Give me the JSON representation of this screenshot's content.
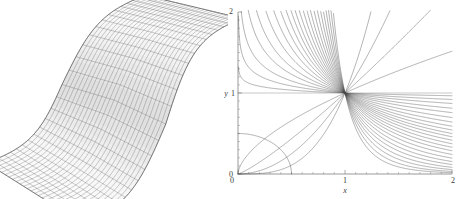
{
  "figure": {
    "title": "",
    "background_color": "#ffffff",
    "panels": [
      {
        "id": "surface-panel",
        "kind": "3d-wireframe-surface"
      },
      {
        "id": "curves-panel",
        "kind": "2d-line-family"
      }
    ]
  },
  "surface_plot": {
    "name": "3d-mesh-surface",
    "description": "Twisted saddle wireframe mesh surface",
    "mesh_color": "#555555",
    "shade_color": "#8a8a8a",
    "grid_u_lines": 26,
    "grid_v_lines": 26,
    "axes_visible": false
  },
  "chart_data": {
    "type": "line",
    "title": "",
    "subtitle": "",
    "xlabel": "x",
    "ylabel": "y",
    "xlim": [
      0,
      2
    ],
    "ylim": [
      0,
      2
    ],
    "xticks": [
      0,
      1,
      2
    ],
    "xticklabels": [
      "0",
      "1",
      "2"
    ],
    "yticks": [
      0,
      1,
      2
    ],
    "yticklabels": [
      "0",
      "1",
      "2"
    ],
    "minor_ticks": true,
    "grid": false,
    "legend": null,
    "line_color": "#4a4a4a",
    "common_point": [
      1,
      1
    ],
    "family_description": "Family of power curves y = x^k all passing through (1,1)",
    "exponents": [
      -6.0,
      -5.0,
      -4.2,
      -3.6,
      -3.1,
      -2.7,
      -2.35,
      -2.05,
      -1.8,
      -1.6,
      -1.42,
      -1.26,
      -1.12,
      -1.0,
      -0.88,
      -0.76,
      -0.64,
      -0.52,
      -0.4,
      -0.3,
      -0.2,
      -0.12,
      -0.05,
      0.0,
      0.6,
      1.2,
      2.0,
      3.2
    ],
    "series": [
      {
        "name": "y = x^-6.0",
        "exponent": -6.0,
        "x": [
          0.02,
          0.5,
          0.75,
          1.0,
          1.25,
          1.5,
          2.0
        ],
        "values": [
          2.0,
          2.0,
          2.0,
          1.0,
          0.262,
          0.088,
          0.0156
        ]
      },
      {
        "name": "y = x^-5.0",
        "exponent": -5.0,
        "x": [
          0.02,
          0.5,
          0.75,
          1.0,
          1.25,
          1.5,
          2.0
        ],
        "values": [
          2.0,
          2.0,
          2.0,
          1.0,
          0.328,
          0.132,
          0.0313
        ]
      },
      {
        "name": "y = x^-4.2",
        "exponent": -4.2,
        "x": [
          0.02,
          0.5,
          0.75,
          1.0,
          1.25,
          1.5,
          2.0
        ],
        "values": [
          2.0,
          2.0,
          2.0,
          1.0,
          0.389,
          0.178,
          0.0544
        ]
      },
      {
        "name": "y = x^-3.6",
        "exponent": -3.6,
        "x": [
          0.02,
          0.5,
          0.75,
          1.0,
          1.25,
          1.5,
          2.0
        ],
        "values": [
          2.0,
          2.0,
          2.0,
          1.0,
          0.443,
          0.222,
          0.0825
        ]
      },
      {
        "name": "y = x^-3.1",
        "exponent": -3.1,
        "x": [
          0.02,
          0.5,
          0.75,
          1.0,
          1.25,
          1.5,
          2.0
        ],
        "values": [
          2.0,
          2.0,
          2.0,
          1.0,
          0.496,
          0.268,
          0.1166
        ]
      },
      {
        "name": "y = x^-2.7",
        "exponent": -2.7,
        "x": [
          0.02,
          0.5,
          0.75,
          1.0,
          1.25,
          1.5,
          2.0
        ],
        "values": [
          2.0,
          2.0,
          2.0,
          1.0,
          0.545,
          0.313,
          0.1539
        ]
      },
      {
        "name": "y = x^-2.35",
        "exponent": -2.35,
        "x": [
          0.02,
          0.5,
          0.75,
          1.0,
          1.25,
          1.5,
          2.0
        ],
        "values": [
          2.0,
          2.0,
          2.0,
          1.0,
          0.594,
          0.36,
          0.196
        ]
      },
      {
        "name": "y = x^-2.05",
        "exponent": -2.05,
        "x": [
          0.02,
          0.5,
          0.75,
          1.0,
          1.25,
          1.5,
          2.0
        ],
        "values": [
          2.0,
          2.0,
          2.0,
          1.0,
          0.639,
          0.406,
          0.2415
        ]
      },
      {
        "name": "y = x^-1.8",
        "exponent": -1.8,
        "x": [
          0.02,
          0.5,
          0.75,
          1.0,
          1.25,
          1.5,
          2.0
        ],
        "values": [
          2.0,
          2.0,
          1.556,
          1.0,
          0.68,
          0.449,
          0.2872
        ]
      },
      {
        "name": "y = x^-1.6",
        "exponent": -1.6,
        "x": [
          0.02,
          0.5,
          0.75,
          1.0,
          1.25,
          1.5,
          2.0
        ],
        "values": [
          2.0,
          2.0,
          1.48,
          1.0,
          0.714,
          0.487,
          0.3299
        ]
      },
      {
        "name": "y = x^-1.42",
        "exponent": -1.42,
        "x": [
          0.02,
          0.5,
          0.75,
          1.0,
          1.25,
          1.5,
          2.0
        ],
        "values": [
          2.0,
          2.0,
          1.418,
          1.0,
          0.745,
          0.524,
          0.374
        ]
      },
      {
        "name": "y = x^-1.26",
        "exponent": -1.26,
        "x": [
          0.02,
          0.5,
          0.75,
          1.0,
          1.25,
          1.5,
          2.0
        ],
        "values": [
          2.0,
          2.0,
          1.365,
          1.0,
          0.773,
          0.558,
          0.4175
        ]
      },
      {
        "name": "y = x^-1.12",
        "exponent": -1.12,
        "x": [
          0.02,
          0.5,
          0.75,
          1.0,
          1.25,
          1.5,
          2.0
        ],
        "values": [
          2.0,
          2.0,
          1.321,
          1.0,
          0.797,
          0.589,
          0.4604
        ]
      },
      {
        "name": "y = x^-1.0",
        "exponent": -1.0,
        "x": [
          0.02,
          0.5,
          0.75,
          1.0,
          1.25,
          1.5,
          2.0
        ],
        "values": [
          2.0,
          2.0,
          1.333,
          1.0,
          0.8,
          0.667,
          0.5
        ]
      },
      {
        "name": "y = x^-0.88",
        "exponent": -0.88,
        "x": [
          0.02,
          0.5,
          0.75,
          1.0,
          1.25,
          1.5,
          2.0
        ],
        "values": [
          2.0,
          1.84,
          1.247,
          1.0,
          0.838,
          0.683,
          0.5437
        ]
      },
      {
        "name": "y = x^-0.76",
        "exponent": -0.76,
        "x": [
          0.02,
          0.5,
          0.75,
          1.0,
          1.25,
          1.5,
          2.0
        ],
        "values": [
          2.0,
          1.693,
          1.212,
          1.0,
          0.856,
          0.712,
          0.5906
        ]
      },
      {
        "name": "y = x^-0.64",
        "exponent": -0.64,
        "x": [
          0.02,
          0.5,
          0.75,
          1.0,
          1.25,
          1.5,
          2.0
        ],
        "values": [
          2.0,
          1.558,
          1.178,
          1.0,
          0.874,
          0.742,
          0.6416
        ]
      },
      {
        "name": "y = x^-0.52",
        "exponent": -0.52,
        "x": [
          0.02,
          0.5,
          0.75,
          1.0,
          1.25,
          1.5,
          2.0
        ],
        "values": [
          2.0,
          1.434,
          1.146,
          1.0,
          0.893,
          0.773,
          0.6971
        ]
      },
      {
        "name": "y = x^-0.4",
        "exponent": -0.4,
        "x": [
          0.02,
          0.5,
          0.75,
          1.0,
          1.25,
          1.5,
          2.0
        ],
        "values": [
          2.0,
          1.32,
          1.12,
          1.0,
          0.915,
          0.81,
          0.7579
        ]
      },
      {
        "name": "y = x^-0.3",
        "exponent": -0.3,
        "x": [
          0.02,
          0.5,
          0.75,
          1.0,
          1.25,
          1.5,
          2.0
        ],
        "values": [
          2.0,
          1.231,
          1.089,
          1.0,
          0.936,
          0.862,
          0.8123
        ]
      },
      {
        "name": "y = x^-0.2",
        "exponent": -0.2,
        "x": [
          0.02,
          0.5,
          0.75,
          1.0,
          1.25,
          1.5,
          2.0
        ],
        "values": [
          2.0,
          1.149,
          1.059,
          1.0,
          0.957,
          0.924,
          0.8706
        ]
      },
      {
        "name": "y = x^-0.12",
        "exponent": -0.12,
        "x": [
          0.02,
          0.5,
          0.75,
          1.0,
          1.25,
          1.5,
          2.0
        ],
        "values": [
          2.0,
          1.087,
          1.035,
          1.0,
          0.974,
          0.954,
          0.9203
        ]
      },
      {
        "name": "y = x^-0.05",
        "exponent": -0.05,
        "x": [
          0.02,
          0.5,
          0.75,
          1.0,
          1.25,
          1.5,
          2.0
        ],
        "values": [
          1.445,
          1.035,
          1.014,
          1.0,
          0.989,
          0.98,
          0.966
        ]
      },
      {
        "name": "y = 1 (k=0)",
        "exponent": 0.0,
        "x": [
          0.0,
          0.5,
          1.0,
          1.5,
          2.0
        ],
        "values": [
          1.0,
          1.0,
          1.0,
          1.0,
          1.0
        ]
      },
      {
        "name": "y = x^0.6",
        "exponent": 0.6,
        "x": [
          0.0,
          0.5,
          1.0,
          1.5,
          2.0
        ],
        "values": [
          0.0,
          0.66,
          1.0,
          1.28,
          1.516
        ]
      },
      {
        "name": "y = x^1.2",
        "exponent": 1.2,
        "x": [
          0.0,
          0.5,
          1.0,
          1.5,
          2.0
        ],
        "values": [
          0.0,
          0.435,
          1.0,
          1.627,
          2.297
        ]
      },
      {
        "name": "y = x^2.0",
        "exponent": 2.0,
        "x": [
          0.0,
          0.5,
          1.0,
          1.5,
          2.0
        ],
        "values": [
          0.0,
          0.25,
          1.0,
          2.25,
          4.0
        ]
      },
      {
        "name": "y = x^3.2",
        "exponent": 3.2,
        "x": [
          0.0,
          0.5,
          1.0,
          1.5,
          2.0
        ],
        "values": [
          0.0,
          0.109,
          1.0,
          3.797,
          9.189
        ]
      }
    ]
  }
}
